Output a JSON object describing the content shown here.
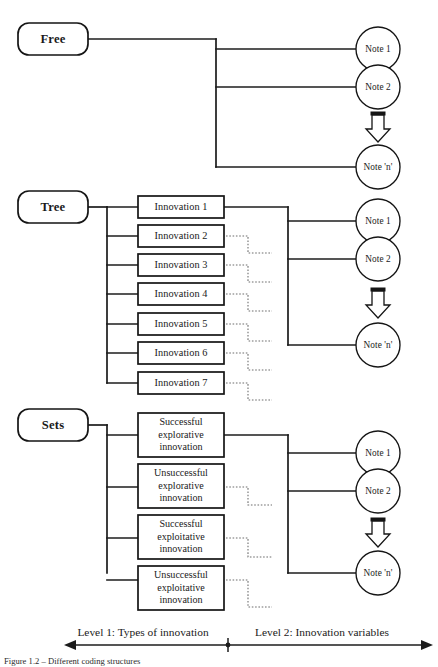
{
  "figure": {
    "caption_fragment": "Figure 1.2 – Different coding structures"
  },
  "sections": [
    {
      "id": "free",
      "root_label": "Free",
      "items": [],
      "notes": [
        "Note 1",
        "Note 2",
        "Note 'n'"
      ],
      "continuation_icon": "down-block-arrow-icon"
    },
    {
      "id": "tree",
      "root_label": "Tree",
      "items": [
        "Innovation 1",
        "Innovation 2",
        "Innovation 3",
        "Innovation 4",
        "Innovation 5",
        "Innovation 6",
        "Innovation 7"
      ],
      "notes": [
        "Note 1",
        "Note 2",
        "Note 'n'"
      ],
      "continuation_icon": "down-block-arrow-icon"
    },
    {
      "id": "sets",
      "root_label": "Sets",
      "items": [
        "Successful\nexplorative\ninnovation",
        "Unsuccessful\nexplorative\ninnovation",
        "Successful\nexploitative\ninnovation",
        "Unsuccessful\nexploitative\ninnovation"
      ],
      "notes": [
        "Note 1",
        "Note 2",
        "Note 'n'"
      ],
      "continuation_icon": "down-block-arrow-icon"
    }
  ],
  "axis": {
    "left_label": "Level 1: Types of innovation",
    "right_label": "Level 2: Innovation variables"
  },
  "colors": {
    "stroke": "#151515",
    "dotted": "#6d6d6d",
    "background": "#ffffff",
    "text": "#1a1a1a"
  }
}
